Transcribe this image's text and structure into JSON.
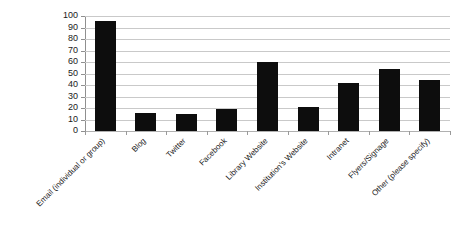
{
  "chart_data": {
    "type": "bar",
    "title": "",
    "subtitle": "",
    "xlabel": "",
    "ylabel": "",
    "ylim": [
      0,
      100
    ],
    "yticks": [
      0,
      10,
      20,
      30,
      40,
      50,
      60,
      70,
      80,
      90,
      100
    ],
    "grid": true,
    "legend": false,
    "legend_position": "none",
    "bar_color": "#0d0d0d",
    "gridline_color": "#c9c9c9",
    "axis_color": "#8f8f8f",
    "background_color": "#ffffff",
    "categories": [
      "Email (individual or group)",
      "Blog",
      "Twitter",
      "Facebook",
      "Library Website",
      "Institution's Website",
      "Intranet",
      "Flyers/Signage",
      "Other (please specify)"
    ],
    "values": [
      96,
      16,
      15,
      19,
      60,
      21,
      42,
      54,
      44
    ]
  }
}
